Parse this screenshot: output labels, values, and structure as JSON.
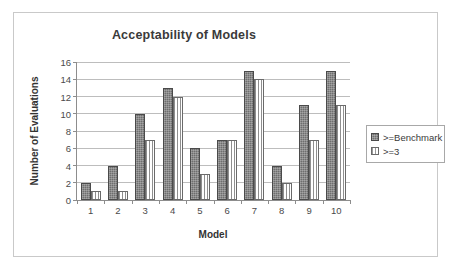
{
  "chart_data": {
    "type": "bar",
    "title": "Acceptability of Models",
    "xlabel": "Model",
    "ylabel": "Number of Evaluations",
    "categories": [
      "1",
      "2",
      "3",
      "4",
      "5",
      "6",
      "7",
      "8",
      "9",
      "10"
    ],
    "series": [
      {
        "name": ">=Benchmark",
        "values": [
          2,
          4,
          10,
          13,
          6,
          7,
          15,
          4,
          11,
          15
        ],
        "color": "#6e6e6e",
        "fill": "checker"
      },
      {
        "name": ">=3",
        "values": [
          1,
          1,
          7,
          12,
          3,
          7,
          14,
          2,
          7,
          11
        ],
        "color": "#ffffff",
        "fill": "dotted-vertical"
      }
    ],
    "ylim": [
      0,
      16
    ],
    "yticks": [
      0,
      2,
      4,
      6,
      8,
      10,
      12,
      14,
      16
    ],
    "ytick_labels": [
      "0",
      "2",
      "4",
      "6",
      "8",
      "10",
      "12",
      "14",
      "16"
    ],
    "grid": "horizontal",
    "legend_position": "right",
    "legend_entries": [
      ">=Benchmark",
      ">=3"
    ]
  },
  "legend": {
    "items": [
      {
        "label": ">=Benchmark"
      },
      {
        "label": ">=3"
      }
    ]
  },
  "colors": {
    "series_benchmark": "#6e6e6e",
    "series_three": "#ffffff",
    "gridline": "#bdbdbd",
    "axis": "#8d8d8d",
    "frame": "#c9c9c9",
    "text": "#3a3a3a"
  }
}
